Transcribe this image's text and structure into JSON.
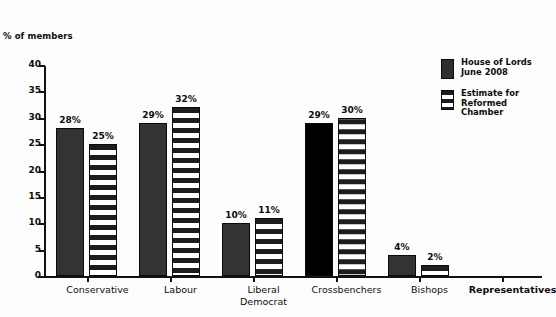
{
  "chart_data": {
    "type": "bar",
    "title": "",
    "ylabel": "% of members",
    "xlabel": "",
    "ylim": [
      0,
      40
    ],
    "ytick_step": 5,
    "yticks": [
      "0",
      "5",
      "10",
      "15",
      "20",
      "25",
      "30",
      "35",
      "40"
    ],
    "grid": false,
    "legend_position": "right",
    "categories": [
      "Conservative",
      "Labour",
      "Liberal\nDemocrat",
      "Crossbenchers",
      "Bishops",
      "Representatives"
    ],
    "series": [
      {
        "name": "House of Lords\nJune 2008",
        "style": "solid",
        "color": "#333333",
        "values": [
          28,
          29,
          10,
          29,
          4,
          null
        ],
        "labels": [
          "28%",
          "29%",
          "10%",
          "29%",
          "4%",
          ""
        ]
      },
      {
        "name": "Estimate for\nReformed\nChamber",
        "style": "striped",
        "color": "#ffffff",
        "values": [
          25,
          32,
          11,
          30,
          2,
          null
        ],
        "labels": [
          "25%",
          "32%",
          "11%",
          "30%",
          "2%",
          ""
        ]
      }
    ],
    "notes": {
      "crossbenchers_solid_color": "#000000",
      "last_category_has_no_bars": true,
      "last_category_label_bold": true
    }
  },
  "legend": {
    "items": [
      {
        "label": "House of Lords\nJune 2008",
        "swatch": "solid-dark-swatch"
      },
      {
        "label": "Estimate for\nReformed\nChamber",
        "swatch": "striped-swatch"
      }
    ]
  },
  "axes": {
    "y_title": "% of members"
  }
}
